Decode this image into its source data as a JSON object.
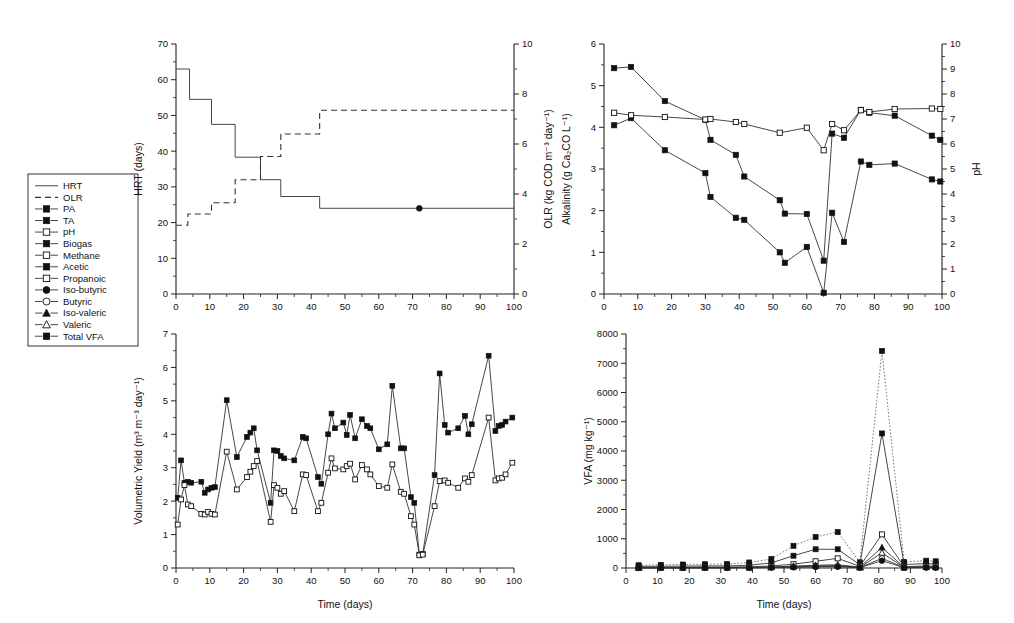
{
  "figure": {
    "title": "",
    "background": "#ffffff",
    "panels": 4
  },
  "legend": {
    "name": "series-legend",
    "items": [
      {
        "label": "HRT",
        "marker": "line",
        "style": "solid"
      },
      {
        "label": "OLR",
        "marker": "line",
        "style": "dashed"
      },
      {
        "label": "PA",
        "marker": "square-filled"
      },
      {
        "label": "TA",
        "marker": "square-filled"
      },
      {
        "label": "pH",
        "marker": "square-open"
      },
      {
        "label": "Biogas",
        "marker": "square-filled"
      },
      {
        "label": "Methane",
        "marker": "square-open"
      },
      {
        "label": "Acetic",
        "marker": "square-filled"
      },
      {
        "label": "Propanoic",
        "marker": "square-open"
      },
      {
        "label": "Iso-butyric",
        "marker": "circle-filled"
      },
      {
        "label": "Butyric",
        "marker": "circle-open"
      },
      {
        "label": "Iso-valeric",
        "marker": "triangle-filled"
      },
      {
        "label": "Valeric",
        "marker": "triangle-open"
      },
      {
        "label": "Total VFA",
        "marker": "square-filled"
      }
    ]
  },
  "chart_data": [
    {
      "id": "hrt-olr",
      "type": "line",
      "title": "",
      "xlabel": "",
      "ylabel": "HRT (days)",
      "y2label": "OLR (kg COD m⁻³ day⁻¹)",
      "xlim": [
        0,
        100
      ],
      "ylim": [
        0,
        70
      ],
      "y2lim": [
        0,
        10
      ],
      "xticks": [
        0,
        10,
        20,
        30,
        40,
        50,
        60,
        70,
        80,
        90,
        100
      ],
      "yticks": [
        0,
        10,
        20,
        30,
        40,
        50,
        60,
        70
      ],
      "y2ticks": [
        0,
        2,
        4,
        6,
        8,
        10
      ],
      "grid": false,
      "legend_position": "external-left",
      "series": [
        {
          "name": "HRT",
          "axis": "left",
          "style": "step-solid",
          "marker": "none",
          "x": [
            0,
            4,
            4,
            10.5,
            10.5,
            17.5,
            17.5,
            25,
            25,
            31,
            31,
            42.5,
            42.5,
            100
          ],
          "y": [
            63,
            63,
            54.5,
            54.5,
            47.5,
            47.5,
            38.3,
            38.3,
            32,
            32,
            27.3,
            27.3,
            24,
            24
          ]
        },
        {
          "name": "OLR",
          "axis": "right",
          "style": "step-dashed",
          "marker": "none",
          "x": [
            0,
            3.5,
            3.5,
            10.5,
            10.5,
            17.5,
            17.5,
            25,
            25,
            31,
            31,
            42.5,
            42.5,
            100
          ],
          "y": [
            2.75,
            2.75,
            3.2,
            3.2,
            3.65,
            3.65,
            4.57,
            4.57,
            5.5,
            5.5,
            6.4,
            6.4,
            7.35,
            7.35
          ]
        },
        {
          "name": "Iso-butyric marker",
          "axis": "left",
          "style": "point-only",
          "marker": "circle-filled",
          "x": [
            72
          ],
          "y": [
            24
          ]
        }
      ]
    },
    {
      "id": "alkalinity-ph",
      "type": "line",
      "title": "",
      "xlabel": "",
      "ylabel": "Alkalinity (g Ca₂CO L⁻¹)",
      "y2label": "pH",
      "xlim": [
        0,
        100
      ],
      "ylim": [
        0,
        6
      ],
      "y2lim": [
        0,
        10
      ],
      "xticks": [
        0,
        10,
        20,
        30,
        40,
        50,
        60,
        70,
        80,
        90,
        100
      ],
      "yticks": [
        0,
        1,
        2,
        3,
        4,
        5,
        6
      ],
      "y2ticks": [
        0,
        1,
        2,
        3,
        4,
        5,
        6,
        7,
        8,
        9,
        10
      ],
      "grid": false,
      "legend_position": "external-left",
      "series": [
        {
          "name": "TA",
          "axis": "left",
          "style": "solid",
          "marker": "square-filled",
          "x": [
            3,
            8,
            18,
            30,
            31.5,
            39,
            41.5,
            52,
            53.5,
            60,
            65,
            67.5,
            71,
            76,
            78.5,
            86,
            97,
            99.5
          ],
          "y": [
            5.42,
            5.45,
            4.63,
            4.18,
            3.7,
            3.34,
            2.82,
            2.25,
            1.93,
            1.92,
            0.8,
            3.85,
            3.75,
            4.42,
            4.35,
            4.28,
            3.8,
            3.7
          ]
        },
        {
          "name": "PA",
          "axis": "left",
          "style": "solid",
          "marker": "square-filled",
          "x": [
            3,
            8,
            18,
            30,
            31.5,
            39,
            41.5,
            52,
            53.5,
            60,
            65,
            67.5,
            71,
            76,
            78.5,
            86,
            97,
            99.5
          ],
          "y": [
            4.05,
            4.22,
            3.45,
            2.9,
            2.33,
            1.83,
            1.78,
            1.0,
            0.75,
            1.13,
            0.03,
            1.95,
            1.25,
            3.18,
            3.1,
            3.13,
            2.75,
            2.7
          ]
        },
        {
          "name": "pH",
          "axis": "right",
          "style": "solid",
          "marker": "square-open",
          "x": [
            3,
            8,
            18,
            30,
            31.5,
            39,
            41.5,
            52,
            60,
            65,
            67.5,
            71,
            76,
            78.5,
            86,
            97,
            99.5
          ],
          "y": [
            7.25,
            7.15,
            7.08,
            6.98,
            7.0,
            6.88,
            6.8,
            6.45,
            6.65,
            5.75,
            6.8,
            6.55,
            7.35,
            7.28,
            7.4,
            7.42,
            7.4
          ]
        }
      ]
    },
    {
      "id": "volumetric-yield",
      "type": "line",
      "title": "",
      "xlabel": "Time (days)",
      "ylabel": "Volumetric Yield (m³ m⁻³ day⁻¹)",
      "xlim": [
        0,
        100
      ],
      "ylim": [
        0,
        7
      ],
      "xticks": [
        0,
        10,
        20,
        30,
        40,
        50,
        60,
        70,
        80,
        90,
        100
      ],
      "yticks": [
        0,
        1,
        2,
        3,
        4,
        5,
        6,
        7
      ],
      "grid": false,
      "legend_position": "external-left",
      "series": [
        {
          "name": "Biogas",
          "axis": "left",
          "style": "solid",
          "marker": "square-filled",
          "x": [
            0.5,
            1.5,
            2.5,
            3.5,
            4.5,
            7.5,
            8.5,
            9.5,
            10.5,
            11.5,
            15,
            18,
            21,
            22,
            23,
            24,
            28,
            29,
            30,
            31,
            32,
            35,
            37.5,
            38.5,
            42,
            43,
            45,
            46,
            47,
            49.5,
            50.5,
            51.5,
            53,
            55,
            56.5,
            57.5,
            60,
            62.5,
            64,
            66.5,
            67.5,
            69.5,
            70.5,
            72,
            73,
            76.5,
            78,
            79.5,
            80.5,
            83.5,
            85.5,
            86.5,
            87.5,
            92.5,
            94.5,
            95.5,
            96.5,
            97.5,
            99.5
          ],
          "y": [
            2.1,
            3.22,
            2.55,
            2.58,
            2.55,
            2.58,
            2.25,
            2.35,
            2.4,
            2.42,
            5.02,
            3.32,
            3.92,
            4.05,
            4.18,
            3.52,
            1.95,
            3.52,
            3.5,
            3.35,
            3.28,
            3.22,
            3.92,
            3.88,
            2.72,
            2.52,
            4.0,
            4.62,
            4.18,
            4.35,
            3.98,
            4.58,
            3.88,
            4.45,
            4.25,
            4.18,
            3.55,
            3.7,
            5.45,
            3.58,
            3.58,
            2.12,
            1.95,
            0.4,
            0.42,
            2.78,
            5.82,
            4.28,
            4.05,
            4.18,
            4.55,
            4.0,
            4.3,
            6.35,
            4.1,
            4.25,
            4.28,
            4.38,
            4.5
          ]
        },
        {
          "name": "Methane",
          "axis": "left",
          "style": "solid",
          "marker": "square-open",
          "x": [
            0.5,
            1.5,
            2.5,
            3.5,
            4.5,
            7.5,
            8.5,
            9.5,
            10.5,
            11.5,
            15,
            18,
            21,
            22,
            23,
            24,
            28,
            29,
            30,
            31,
            32,
            35,
            37.5,
            38.5,
            42,
            43,
            45,
            46,
            47,
            49.5,
            50.5,
            51.5,
            53,
            55,
            56.5,
            57.5,
            60,
            62.5,
            64,
            66.5,
            67.5,
            69.5,
            70.5,
            72,
            73,
            76.5,
            78,
            79.5,
            80.5,
            83.5,
            85.5,
            86.5,
            87.5,
            92.5,
            94.5,
            95.5,
            96.5,
            97.5,
            99.5
          ],
          "y": [
            1.3,
            2.05,
            2.48,
            1.9,
            1.85,
            1.62,
            1.6,
            1.68,
            1.62,
            1.6,
            3.48,
            2.35,
            2.72,
            2.88,
            3.05,
            3.2,
            1.38,
            2.48,
            2.4,
            2.22,
            2.3,
            1.7,
            2.8,
            2.78,
            1.7,
            1.95,
            2.85,
            3.28,
            2.98,
            2.95,
            3.05,
            3.12,
            2.65,
            3.08,
            2.95,
            2.8,
            2.45,
            2.4,
            3.1,
            2.28,
            2.22,
            1.55,
            1.3,
            0.38,
            0.4,
            1.85,
            2.6,
            2.62,
            2.55,
            2.4,
            2.68,
            2.58,
            2.78,
            4.5,
            2.62,
            2.68,
            2.7,
            2.8,
            3.15
          ]
        }
      ]
    },
    {
      "id": "vfa",
      "type": "line",
      "title": "",
      "xlabel": "Time (days)",
      "ylabel": "VFA (mg kg⁻¹)",
      "xlim": [
        0,
        100
      ],
      "ylim": [
        0,
        8000
      ],
      "xticks": [
        0,
        10,
        20,
        30,
        40,
        50,
        60,
        70,
        80,
        90,
        100
      ],
      "yticks": [
        0,
        1000,
        2000,
        3000,
        4000,
        5000,
        6000,
        7000,
        8000
      ],
      "grid": false,
      "legend_position": "external-left",
      "series": [
        {
          "name": "Total VFA",
          "axis": "left",
          "style": "dotted",
          "marker": "square-filled",
          "x": [
            4,
            11,
            18,
            25,
            32,
            39,
            46,
            53,
            60,
            67,
            74,
            81,
            88,
            95,
            98
          ],
          "y": [
            95,
            110,
            120,
            130,
            135,
            190,
            310,
            760,
            1060,
            1230,
            195,
            7420,
            210,
            250,
            230
          ]
        },
        {
          "name": "Acetic",
          "axis": "left",
          "style": "solid",
          "marker": "square-filled",
          "x": [
            4,
            11,
            18,
            25,
            32,
            39,
            46,
            53,
            60,
            67,
            74,
            81,
            88,
            95,
            98
          ],
          "y": [
            55,
            60,
            65,
            70,
            70,
            95,
            175,
            420,
            640,
            640,
            110,
            4600,
            120,
            150,
            140
          ]
        },
        {
          "name": "Propanoic",
          "axis": "left",
          "style": "solid",
          "marker": "square-open",
          "x": [
            4,
            11,
            18,
            25,
            32,
            39,
            46,
            53,
            60,
            67,
            74,
            81,
            88,
            95,
            98
          ],
          "y": [
            20,
            22,
            25,
            28,
            30,
            40,
            70,
            130,
            230,
            330,
            55,
            1150,
            45,
            70,
            60
          ]
        },
        {
          "name": "Iso-valeric",
          "axis": "left",
          "style": "solid",
          "marker": "triangle-filled",
          "x": [
            4,
            11,
            18,
            25,
            32,
            39,
            46,
            53,
            60,
            67,
            74,
            81,
            88,
            95,
            98
          ],
          "y": [
            12,
            13,
            14,
            15,
            16,
            22,
            35,
            65,
            95,
            110,
            30,
            700,
            25,
            40,
            35
          ]
        },
        {
          "name": "Valeric",
          "axis": "left",
          "style": "solid",
          "marker": "triangle-open",
          "x": [
            4,
            11,
            18,
            25,
            32,
            39,
            46,
            53,
            60,
            67,
            74,
            81,
            88,
            95,
            98
          ],
          "y": [
            8,
            9,
            10,
            11,
            12,
            16,
            25,
            45,
            70,
            80,
            22,
            520,
            18,
            30,
            25
          ]
        },
        {
          "name": "Butyric",
          "axis": "left",
          "style": "solid",
          "marker": "circle-open",
          "x": [
            4,
            11,
            18,
            25,
            32,
            39,
            46,
            53,
            60,
            67,
            74,
            81,
            88,
            95,
            98
          ],
          "y": [
            6,
            7,
            8,
            8,
            9,
            12,
            18,
            32,
            50,
            58,
            16,
            330,
            14,
            22,
            18
          ]
        },
        {
          "name": "Iso-butyric",
          "axis": "left",
          "style": "solid",
          "marker": "circle-filled",
          "x": [
            4,
            11,
            18,
            25,
            32,
            39,
            46,
            53,
            60,
            67,
            74,
            81,
            88,
            95,
            98
          ],
          "y": [
            5,
            5,
            6,
            6,
            7,
            9,
            14,
            24,
            38,
            44,
            12,
            250,
            10,
            16,
            14
          ]
        }
      ]
    }
  ]
}
